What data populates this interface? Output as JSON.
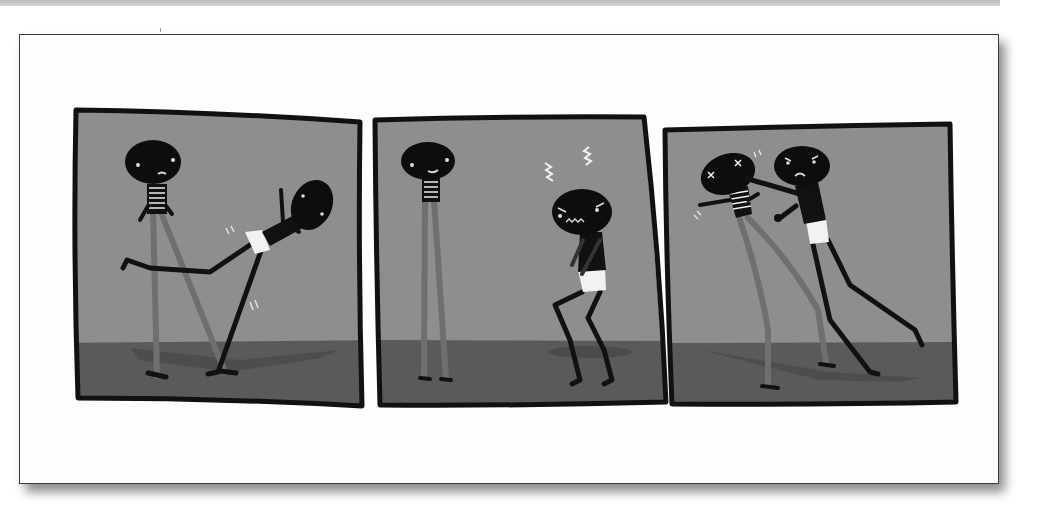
{
  "image": {
    "type": "three-panel wordless comic strip",
    "has_text": false
  },
  "colors": {
    "wall": "#8e8e8e",
    "floor": "#5a5a5a",
    "outline": "#111111",
    "character": "#0d0d0d",
    "tall_legs": "#6f6f6f",
    "shorts": "#f2f2f2",
    "frame_border": "#3a3a3a",
    "page": "#fdfdfd",
    "top_strip": "#c8c8c8"
  },
  "panels": [
    {
      "index": 1,
      "description": "Short character in white shorts kicks the tall striped-shirt character's leg; tall character smiles"
    },
    {
      "index": 2,
      "description": "Tall character stands smiling; short character hunched, angry, with zigzag anger marks above head"
    },
    {
      "index": 3,
      "description": "Short angry character punches the tall character in the face; tall character has X eyes"
    }
  ]
}
